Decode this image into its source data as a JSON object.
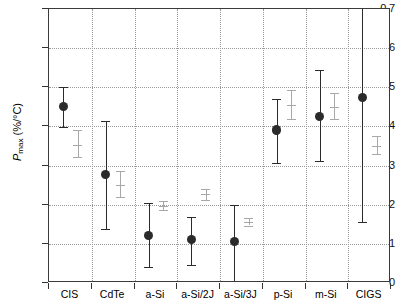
{
  "chart_data": {
    "type": "scatter",
    "title": "",
    "xlabel": "",
    "ylabel": "Pmax (%/°C)",
    "ylabel_base": "P",
    "ylabel_sub": "max",
    "ylabel_units": " (%/°C)",
    "ylim": [
      0,
      0.7
    ],
    "ytick_values": [
      0,
      0.1,
      0.2,
      0.3,
      0.4,
      0.5,
      0.6,
      0.7
    ],
    "ytick_labels": [
      "0",
      "0.1",
      "0.2",
      "0.3",
      "0.4",
      "0.5",
      "0.6",
      "0.7"
    ],
    "grid": true,
    "legend_position": "none",
    "categories": [
      "CIS",
      "CdTe",
      "a-Si",
      "a-Si/2J",
      "a-Si/3J",
      "p-Si",
      "m-Si",
      "CIGS"
    ],
    "series": [
      {
        "name": "dark-filled",
        "marker": "filled-circle",
        "color": "#2b2b2b",
        "values": [
          0.45,
          0.278,
          0.122,
          0.11,
          0.106,
          0.391,
          0.425,
          0.475
        ],
        "err_low": [
          0.398,
          0.138,
          0.04,
          0.047,
          0.0,
          0.307,
          0.311,
          0.155
        ],
        "err_high": [
          0.5,
          0.415,
          0.205,
          0.17,
          0.2,
          0.47,
          0.545,
          0.7
        ]
      },
      {
        "name": "light-open",
        "marker": "tick",
        "color": "#a8a8a8",
        "values": [
          0.353,
          0.25,
          0.196,
          0.227,
          0.155,
          0.455,
          0.45,
          0.349
        ],
        "err_low": [
          0.322,
          0.22,
          0.186,
          0.211,
          0.147,
          0.418,
          0.419,
          0.329
        ],
        "err_high": [
          0.392,
          0.285,
          0.21,
          0.241,
          0.165,
          0.492,
          0.486,
          0.375
        ]
      }
    ]
  }
}
